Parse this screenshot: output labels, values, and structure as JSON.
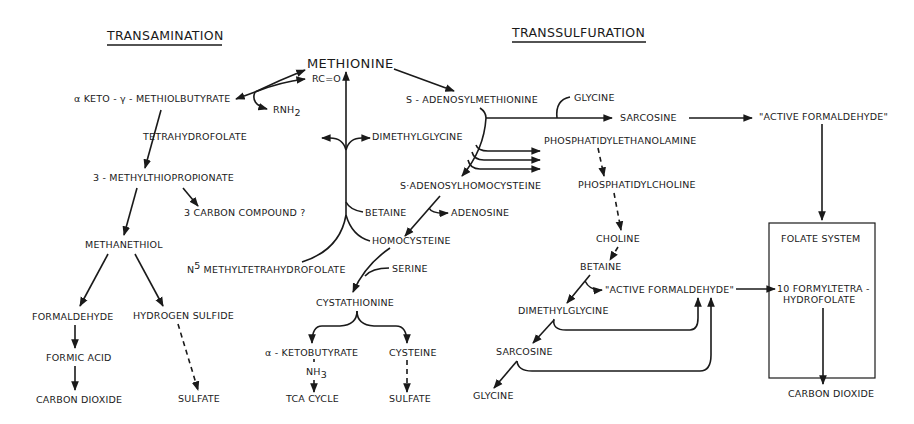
{
  "sections": {
    "transamination": "TRANSAMINATION",
    "transsulfuration": "TRANSSULFURATION"
  },
  "center": {
    "methionine": "METHIONINE",
    "rc_o": "RC=O",
    "rnh2": "RNH",
    "rnh2_sub": "2",
    "tetrahydrofolate": "TETRAHYDROFOLATE",
    "dimethylglycine": "DIMETHYLGLYCINE",
    "betaine": "BETAINE",
    "homocysteine": "HOMOCYSTEINE",
    "n5_sup": "5",
    "n5_prefix": "N",
    "n5_methyltetrahydrofolate": "METHYLTETRAHYDROFOLATE",
    "serine": "SERINE",
    "cystathionine": "CYSTATHIONINE",
    "alpha_ketobutyrate": "α - KETOBUTYRATE",
    "nh3": "NH",
    "nh3_sub": "3",
    "tca_cycle": "TCA CYCLE",
    "cysteine": "CYSTEINE",
    "sulfate": "SULFATE"
  },
  "transamination": {
    "alpha_keto": "α KETO - γ - METHIOLBUTYRATE",
    "methylthiopropionate": "3 - METHYLTHIOPROPIONATE",
    "three_carbon": "3 CARBON COMPOUND ?",
    "methanethiol": "METHANETHIOL",
    "formaldehyde": "FORMALDEHYDE",
    "hydrogen_sulfide": "HYDROGEN SULFIDE",
    "formic_acid": "FORMIC ACID",
    "carbon_dioxide": "CARBON DIOXIDE",
    "sulfate": "SULFATE"
  },
  "transsulfuration": {
    "s_adenosylmethionine": "S - ADENOSYLMETHIONINE",
    "glycine_top": "GLYCINE",
    "sarcosine_top": "SARCOSINE",
    "active_formaldehyde_top": "\"ACTIVE FORMALDEHYDE\"",
    "phosphatidylethanolamine": "PHOSPHATIDYLETHANOLAMINE",
    "s_adenosylhomocysteine": "S·ADENOSYLHOMOCYSTEINE",
    "adenosine": "ADENOSINE",
    "phosphatidylcholine": "PHOSPHATIDYLCHOLINE",
    "choline": "CHOLINE",
    "betaine": "BETAINE",
    "active_formaldehyde_mid": "\"ACTIVE FORMALDEHYDE\"",
    "dimethylglycine": "DIMETHYLGLYCINE",
    "sarcosine": "SARCOSINE",
    "glycine": "GLYCINE"
  },
  "folate_system": {
    "title": "FOLATE SYSTEM",
    "formyl_line1": "10 FORMYLTETRA -",
    "formyl_line2": "HYDROFOLATE",
    "carbon_dioxide": "CARBON DIOXIDE"
  }
}
